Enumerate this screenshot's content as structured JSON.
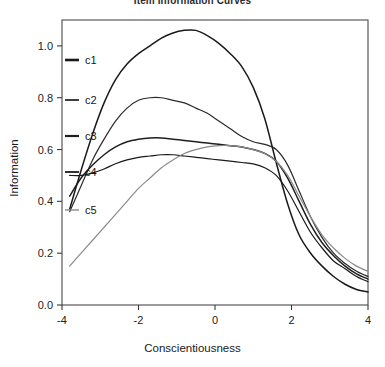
{
  "chart_data": {
    "type": "line",
    "title": "Item Information Curves",
    "xlabel": "Conscientiousness",
    "ylabel": "Information",
    "xlim": [
      -4,
      4
    ],
    "ylim": [
      0.0,
      1.1
    ],
    "grid": false,
    "legend_position": "left-inside",
    "xticks": [
      "-4",
      "-2",
      "0",
      "2",
      "4"
    ],
    "xtick_values": [
      -4,
      -2,
      0,
      2,
      4
    ],
    "yticks": [
      "0.0",
      "0.2",
      "0.4",
      "0.6",
      "0.8",
      "1.0"
    ],
    "ytick_values": [
      0.0,
      0.2,
      0.4,
      0.6,
      0.8,
      1.0
    ],
    "x": [
      -3.8,
      -3.5,
      -3.2,
      -2.9,
      -2.6,
      -2.3,
      -2.0,
      -1.7,
      -1.4,
      -1.1,
      -0.8,
      -0.5,
      -0.2,
      0.1,
      0.4,
      0.7,
      1.0,
      1.3,
      1.6,
      1.9,
      2.2,
      2.5,
      2.8,
      3.1,
      3.4,
      3.7,
      4.0
    ],
    "series": [
      {
        "name": "c1",
        "color": "#1a1a1a",
        "width": 1.5,
        "values": [
          0.37,
          0.52,
          0.66,
          0.78,
          0.87,
          0.93,
          0.97,
          1.0,
          1.03,
          1.05,
          1.06,
          1.06,
          1.04,
          1.01,
          0.97,
          0.92,
          0.84,
          0.72,
          0.55,
          0.39,
          0.27,
          0.2,
          0.15,
          0.11,
          0.08,
          0.06,
          0.05
        ]
      },
      {
        "name": "c2",
        "color": "#2a2a2a",
        "width": 1.2,
        "values": [
          0.36,
          0.46,
          0.56,
          0.64,
          0.71,
          0.76,
          0.79,
          0.8,
          0.8,
          0.79,
          0.78,
          0.76,
          0.74,
          0.71,
          0.68,
          0.65,
          0.63,
          0.62,
          0.6,
          0.54,
          0.44,
          0.34,
          0.26,
          0.2,
          0.16,
          0.13,
          0.11
        ]
      },
      {
        "name": "c3",
        "color": "#1f1f1f",
        "width": 1.5,
        "values": [
          0.42,
          0.49,
          0.54,
          0.58,
          0.61,
          0.63,
          0.64,
          0.645,
          0.645,
          0.64,
          0.635,
          0.63,
          0.625,
          0.62,
          0.615,
          0.61,
          0.6,
          0.585,
          0.555,
          0.49,
          0.4,
          0.31,
          0.24,
          0.19,
          0.15,
          0.12,
          0.1
        ]
      },
      {
        "name": "c4",
        "color": "#1a1a1a",
        "width": 1.2,
        "values": [
          0.5,
          0.5,
          0.51,
          0.525,
          0.545,
          0.56,
          0.57,
          0.575,
          0.58,
          0.58,
          0.575,
          0.57,
          0.565,
          0.56,
          0.555,
          0.55,
          0.545,
          0.53,
          0.5,
          0.44,
          0.36,
          0.28,
          0.22,
          0.17,
          0.14,
          0.11,
          0.09
        ]
      },
      {
        "name": "c5",
        "color": "#8a8a8a",
        "width": 1.2,
        "values": [
          0.15,
          0.2,
          0.25,
          0.3,
          0.35,
          0.4,
          0.45,
          0.49,
          0.53,
          0.56,
          0.585,
          0.6,
          0.61,
          0.615,
          0.615,
          0.61,
          0.6,
          0.585,
          0.555,
          0.5,
          0.42,
          0.34,
          0.27,
          0.22,
          0.18,
          0.15,
          0.13
        ]
      }
    ],
    "legend": [
      {
        "label": "c1",
        "color": "#1a1a1a",
        "width": 2.6
      },
      {
        "label": "c2",
        "color": "#2a2a2a",
        "width": 1.8
      },
      {
        "label": "c3",
        "color": "#1f1f1f",
        "width": 2.2
      },
      {
        "label": "c4",
        "color": "#1a1a1a",
        "width": 1.8
      },
      {
        "label": "c5",
        "color": "#8a8a8a",
        "width": 1.4
      }
    ]
  }
}
